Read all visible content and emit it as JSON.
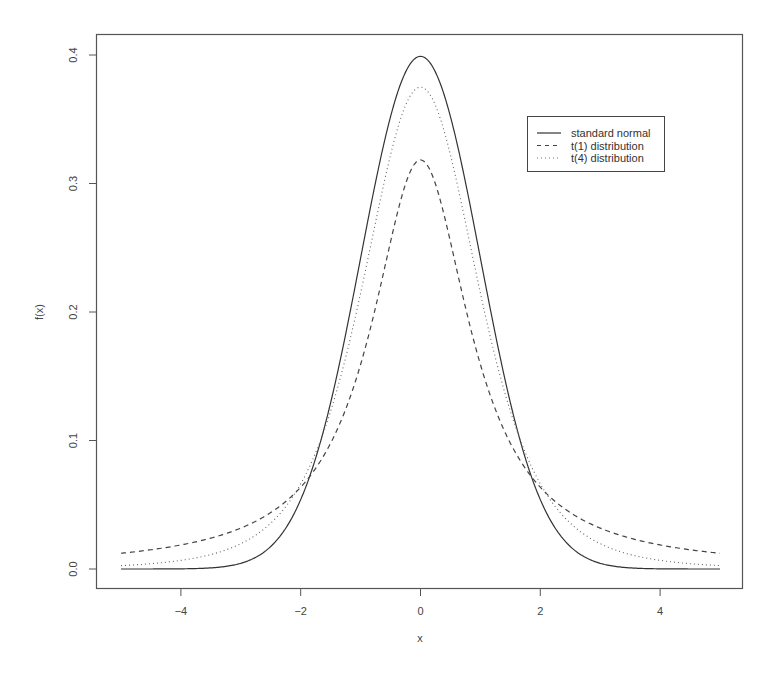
{
  "chart_data": {
    "type": "line",
    "title": "",
    "xlabel": "x",
    "ylabel": "f(x)",
    "xlim": [
      -5,
      5
    ],
    "ylim": [
      0,
      0.4
    ],
    "x_ticks": [
      -4,
      -2,
      0,
      2,
      4
    ],
    "x_tick_labels": [
      "−4",
      "−2",
      "0",
      "2",
      "4"
    ],
    "y_ticks": [
      0.0,
      0.1,
      0.2,
      0.3,
      0.4
    ],
    "y_tick_labels": [
      "0.0",
      "0.1",
      "0.2",
      "0.3",
      "0.4"
    ],
    "grid": false,
    "legend_position": "top-right",
    "x": [
      -5,
      -4.5,
      -4,
      -3.5,
      -3,
      -2.5,
      -2,
      -1.5,
      -1,
      -0.5,
      0,
      0.5,
      1,
      1.5,
      2,
      2.5,
      3,
      3.5,
      4,
      4.5,
      5
    ],
    "series": [
      {
        "name": "standard normal",
        "line_style": "solid",
        "values": [
          0.0,
          0.0,
          0.0001,
          0.0009,
          0.0044,
          0.0175,
          0.054,
          0.1295,
          0.242,
          0.3521,
          0.3989,
          0.3521,
          0.242,
          0.1295,
          0.054,
          0.0175,
          0.0044,
          0.0009,
          0.0001,
          0.0,
          0.0
        ]
      },
      {
        "name": "t(1) distribution",
        "line_style": "dashed",
        "values": [
          0.0122,
          0.0149,
          0.0187,
          0.0241,
          0.0318,
          0.0439,
          0.0637,
          0.0979,
          0.1592,
          0.2546,
          0.3183,
          0.2546,
          0.1592,
          0.0979,
          0.0637,
          0.0439,
          0.0318,
          0.0241,
          0.0187,
          0.0149,
          0.0122
        ]
      },
      {
        "name": "t(4) distribution",
        "line_style": "dotted",
        "values": [
          0.0042,
          0.0063,
          0.0067,
          0.0111,
          0.0197,
          0.0306,
          0.0663,
          0.1245,
          0.2147,
          0.3221,
          0.375,
          0.3221,
          0.2147,
          0.1245,
          0.0663,
          0.0306,
          0.0197,
          0.0111,
          0.0067,
          0.0063,
          0.0042
        ]
      }
    ]
  },
  "legend": {
    "items": [
      {
        "label": "standard normal",
        "style": "solid"
      },
      {
        "label": "t(1) distribution",
        "style": "dashed"
      },
      {
        "label": "t(4) distribution",
        "style": "dotted"
      }
    ]
  },
  "colors": {
    "frame": "#555555",
    "line": "#333333"
  }
}
